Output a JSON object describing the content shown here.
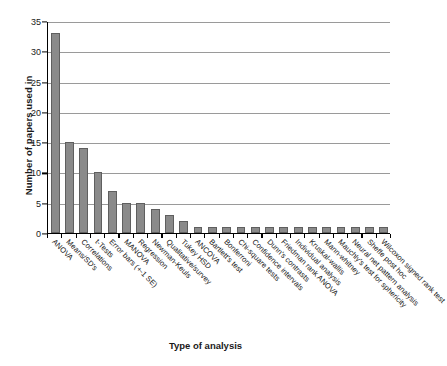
{
  "chart_data": {
    "type": "bar",
    "title": "",
    "xlabel": "Type of analysis",
    "ylabel": "Number of papers used in",
    "ylim": [
      0,
      35
    ],
    "yticks": [
      0,
      5,
      10,
      15,
      20,
      25,
      30,
      35
    ],
    "grid": "horizontal",
    "legend": "none",
    "bar_color": "#8a8a8a",
    "bar_edge_color": "#5f5f5f",
    "categories": [
      "ANOVA",
      "Means/SD's",
      "Correlations",
      "t-Tests",
      "Error bars (+-1 SE)",
      "MANOVA",
      "Regression",
      "Newman-Keuls",
      "Qualitative/survey",
      "Tukey HSD",
      "ANCOVA",
      "Bartlett's test",
      "Bonferroni",
      "Chi-square tests",
      "Confidence intervals",
      "Dunn's contrasts",
      "Friedman rank ANOVA",
      "Individual analysis",
      "Kruskal-wallis",
      "Mann-whitney",
      "Mauchly's test for sphericity",
      "Neural net pattern analysis",
      "Sheffe post hoc",
      "Wilcoxon signed rank test"
    ],
    "values": [
      33,
      15,
      14,
      10,
      7,
      5,
      5,
      4,
      3,
      2,
      1,
      1,
      1,
      1,
      1,
      1,
      1,
      1,
      1,
      1,
      1,
      1,
      1,
      1
    ]
  }
}
